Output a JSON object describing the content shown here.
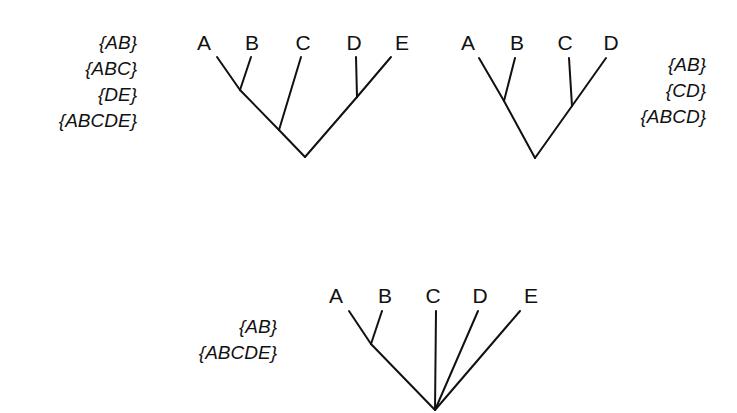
{
  "diagram": {
    "trees": [
      {
        "id": "tree-1",
        "leaves": [
          "A",
          "B",
          "C",
          "D",
          "E"
        ],
        "clusters": [
          "{AB}",
          "{ABC}",
          "{DE}",
          "{ABCDE}"
        ],
        "cluster_position": "left"
      },
      {
        "id": "tree-2",
        "leaves": [
          "A",
          "B",
          "C",
          "D"
        ],
        "clusters": [
          "{AB}",
          "{CD}",
          "{ABCD}"
        ],
        "cluster_position": "right"
      },
      {
        "id": "tree-3",
        "leaves": [
          "A",
          "B",
          "C",
          "D",
          "E"
        ],
        "clusters": [
          "{AB}",
          "{ABCDE}"
        ],
        "cluster_position": "left"
      }
    ]
  }
}
